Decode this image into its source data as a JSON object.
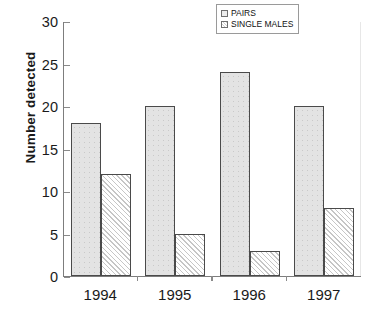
{
  "chart_data": {
    "type": "bar",
    "title": "",
    "xlabel": "",
    "ylabel": "Number detected",
    "categories": [
      "1994",
      "1995",
      "1996",
      "1997"
    ],
    "series": [
      {
        "name": "PAIRS",
        "values": [
          18,
          20,
          24,
          20
        ],
        "fill": "stipple-gray",
        "color": "#e3e3e3"
      },
      {
        "name": "SINGLE MALES",
        "values": [
          12,
          5,
          3,
          8
        ],
        "fill": "diagonal-hatch",
        "color": "#fbfbfb"
      }
    ],
    "ylim": [
      0,
      30
    ],
    "yticks": [
      0,
      5,
      10,
      15,
      20,
      25,
      30
    ],
    "ytick_labels": [
      "0",
      "5",
      "10",
      "15",
      "20",
      "25",
      "30"
    ],
    "grid": false,
    "legend_position": "top-right",
    "axis_color": "#7d7d7d",
    "bar_edge_color": "#4a4a4a",
    "background": "#ffffff"
  },
  "legend": {
    "entries": [
      {
        "label": "PAIRS"
      },
      {
        "label": "SINGLE MALES"
      }
    ]
  }
}
